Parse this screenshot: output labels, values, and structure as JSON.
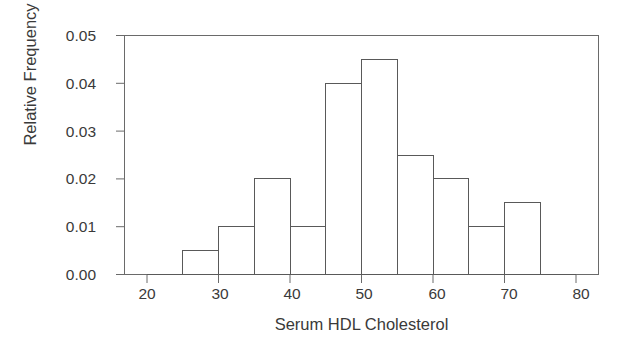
{
  "chart_data": {
    "type": "bar",
    "title": "",
    "subtitle": "",
    "xlabel": "Serum HDL Cholesterol",
    "ylabel": "Relative Frequency",
    "xlim": [
      20,
      80
    ],
    "ylim": [
      0.0,
      0.05
    ],
    "grid": false,
    "legend": "none",
    "bin_width": 5,
    "bin_edges": [
      25,
      30,
      35,
      40,
      45,
      50,
      55,
      60,
      65,
      70,
      75
    ],
    "categories": [
      "25-30",
      "30-35",
      "35-40",
      "40-45",
      "45-50",
      "50-55",
      "55-60",
      "60-65",
      "65-70",
      "70-75"
    ],
    "values": [
      0.005,
      0.01,
      0.02,
      0.01,
      0.04,
      0.045,
      0.025,
      0.02,
      0.01,
      0.015
    ],
    "xticks": [
      20,
      30,
      40,
      50,
      60,
      70,
      80
    ],
    "xtick_labels": [
      "20",
      "30",
      "40",
      "50",
      "60",
      "70",
      "80"
    ],
    "yticks": [
      0.0,
      0.01,
      0.02,
      0.03,
      0.04,
      0.05
    ],
    "ytick_labels": [
      "0.00",
      "0.01",
      "0.02",
      "0.03",
      "0.04",
      "0.05"
    ],
    "bar_fill_color": "#ffffff",
    "bar_edge_color": "#595959",
    "axis_color": "#6a6a6a",
    "text_color": "#3a3a3a",
    "background_color": "#ffffff"
  }
}
